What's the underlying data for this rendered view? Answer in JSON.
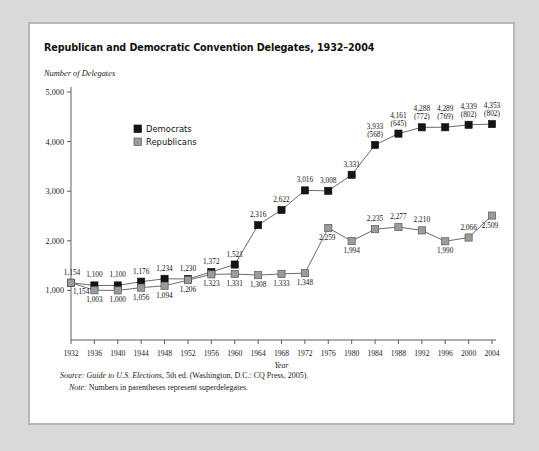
{
  "card": {
    "title": "Republican and Democratic Convention Delegates, 1932–2004",
    "y_axis_caption": "Number of Delegates"
  },
  "notes": {
    "source_label": "Source:",
    "source_title": "Guide to U.S. Elections,",
    "source_rest": " 5th ed. (Washington, D.C.: CQ Press, 2005).",
    "note_label": "Note:",
    "note_text": " Numbers in parentheses represent superdelegates."
  },
  "chart_data": {
    "type": "line",
    "title": "Republican and Democratic Convention Delegates, 1932–2004",
    "xlabel": "Year",
    "ylabel": "Number of Delegates",
    "ylim": [
      0,
      5000
    ],
    "yticks": [
      1000,
      2000,
      3000,
      4000,
      5000
    ],
    "ytick_labels": [
      "1,000",
      "2,000",
      "3,000",
      "4,000",
      "5,000"
    ],
    "grid": false,
    "legend_position": "upper-left-inside",
    "categories": [
      1932,
      1936,
      1940,
      1944,
      1948,
      1952,
      1956,
      1960,
      1964,
      1968,
      1972,
      1976,
      1980,
      1984,
      1988,
      1992,
      1996,
      2000,
      2004
    ],
    "xtick_labels": [
      "1932",
      "1936",
      "1940",
      "1944",
      "1948",
      "1952",
      "1956",
      "1960",
      "1964",
      "1968",
      "1972",
      "1976",
      "1980",
      "1984",
      "1988",
      "1992",
      "1996",
      "2000",
      "2004"
    ],
    "series": [
      {
        "name": "Democrats",
        "color": "#141414",
        "marker": "filled-square",
        "values": [
          1154,
          1100,
          1100,
          1176,
          1234,
          1230,
          1372,
          1521,
          2316,
          2622,
          3016,
          3008,
          3331,
          3933,
          4161,
          4288,
          4289,
          4339,
          4353
        ],
        "labels": [
          "1,154",
          "1,100",
          "1,100",
          "1,176",
          "1,234",
          "1,230",
          "1,372",
          "1,521",
          "2,316",
          "2,622",
          "3,016",
          "3,008",
          "3,331",
          "3,933",
          "4,161",
          "4,288",
          "4,289",
          "4,339",
          "4,353"
        ],
        "superdelegates": [
          null,
          null,
          null,
          null,
          null,
          null,
          null,
          null,
          null,
          null,
          null,
          null,
          null,
          568,
          645,
          772,
          769,
          802,
          802
        ],
        "superdelegate_labels": [
          "",
          "",
          "",
          "",
          "",
          "",
          "",
          "",
          "",
          "",
          "",
          "",
          "",
          "(568)",
          "(645)",
          "(772)",
          "(769)",
          "(802)",
          "(802)"
        ]
      },
      {
        "name": "Republicans",
        "color": "#9b9b9b",
        "marker": "gray-square",
        "values": [
          1154,
          1003,
          1000,
          1056,
          1094,
          1206,
          1323,
          1331,
          1308,
          1333,
          1348,
          2259,
          1994,
          2235,
          2277,
          2210,
          1990,
          2066,
          2509
        ],
        "labels": [
          "1,154",
          "1,003",
          "1,000",
          "1,056",
          "1,094",
          "1,206",
          "1,323",
          "1,331",
          "1,308",
          "1,333",
          "1,348",
          "2,259",
          "1,994",
          "2,235",
          "2,277",
          "2,210",
          "1,990",
          "2,066",
          "2,509"
        ]
      }
    ],
    "legend": [
      {
        "label": "Democrats",
        "color": "#141414"
      },
      {
        "label": "Republicans",
        "color": "#9b9b9b"
      }
    ]
  }
}
